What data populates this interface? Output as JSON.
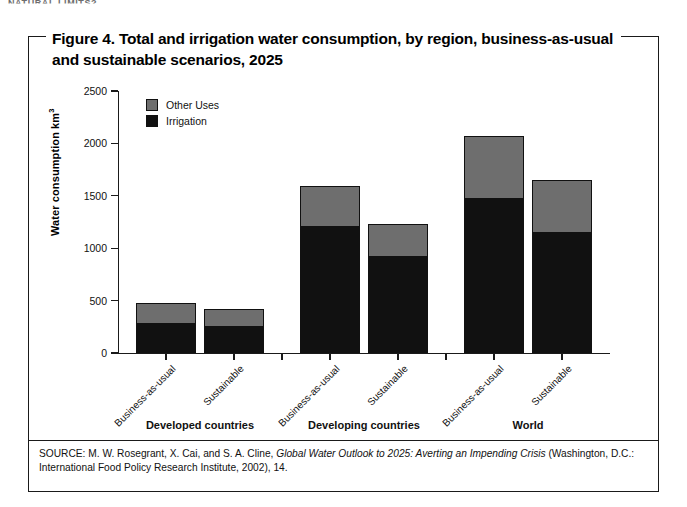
{
  "running_head": "NATURAL LIMITS?",
  "figure": {
    "title_line1": "Figure 4. Total and irrigation water consumption, by region, business-as-usual",
    "title_line2": "and sustainable scenarios, 2025",
    "source_prefix": "SOURCE: M. W. Rosegrant, X. Cai, and S. A. Cline, ",
    "source_italic": "Global Water Outlook to 2025: Averting an Impending Crisis",
    "source_suffix": " (Washington, D.C.: International Food Policy Research Institute, 2002), 14."
  },
  "colors": {
    "other_uses": "#6e6e6e",
    "irrigation": "#111111",
    "axis": "#1a1a1a",
    "background": "#ffffff"
  },
  "chart_data": {
    "type": "bar",
    "subtype": "stacked",
    "title": "Figure 4. Total and irrigation water consumption, by region, business-as-usual and sustainable scenarios, 2025",
    "xlabel": "",
    "ylabel": "Water consumption km³",
    "ylim": [
      0,
      2500
    ],
    "yticks": [
      0,
      500,
      1000,
      1500,
      2000,
      2500
    ],
    "ytick_labels": [
      "0",
      "500",
      "1000",
      "1500",
      "2000",
      "2500"
    ],
    "grid": false,
    "legend_position": "upper-left-inside",
    "legend": [
      "Other Uses",
      "Irrigation"
    ],
    "groups": [
      {
        "label": "Developed countries",
        "scenarios": [
          "Business-as-usual",
          "Sustainable"
        ]
      },
      {
        "label": "Developing countries",
        "scenarios": [
          "Business-as-usual",
          "Sustainable"
        ]
      },
      {
        "label": "World",
        "scenarios": [
          "Business-as-usual",
          "Sustainable"
        ]
      }
    ],
    "categories": [
      "Developed countries — Business-as-usual",
      "Developed countries — Sustainable",
      "Developing countries — Business-as-usual",
      "Developing countries — Sustainable",
      "World — Business-as-usual",
      "World — Sustainable"
    ],
    "series": [
      {
        "name": "Irrigation",
        "color": "#111111",
        "values": [
          285,
          260,
          1215,
          925,
          1480,
          1155
        ]
      },
      {
        "name": "Other Uses",
        "color": "#6e6e6e",
        "values": [
          190,
          160,
          375,
          310,
          590,
          500
        ]
      }
    ],
    "totals": [
      475,
      420,
      1590,
      1235,
      2070,
      1655
    ]
  }
}
